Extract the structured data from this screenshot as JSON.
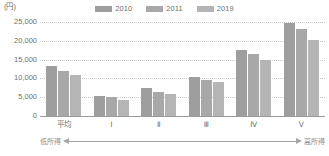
{
  "chart_data": {
    "type": "bar",
    "title": "",
    "subtitle": "",
    "unit_label": "(円)",
    "xlabel": "",
    "ylabel": "",
    "ylim": [
      0,
      25000
    ],
    "ytick_values": [
      25000,
      20000,
      15000,
      10000,
      5000,
      0
    ],
    "ytick_labels": [
      "25,000",
      "20,000",
      "15,000",
      "10,000",
      "5,000",
      "0"
    ],
    "grid": true,
    "legend_position": "top-center",
    "categories": [
      "平均",
      "Ⅰ",
      "Ⅱ",
      "Ⅲ",
      "Ⅳ",
      "Ⅴ"
    ],
    "series": [
      {
        "name": "2010",
        "color": "#9e9e9e",
        "values": [
          13200,
          5300,
          7500,
          10500,
          17600,
          24800
        ]
      },
      {
        "name": "2011",
        "color": "#a8a8a8",
        "values": [
          12100,
          5000,
          6400,
          9600,
          16500,
          23100
        ]
      },
      {
        "name": "2019",
        "color": "#b5b5b5",
        "values": [
          10800,
          4200,
          5900,
          9100,
          14900,
          20300
        ]
      }
    ],
    "annotations": {
      "income_low": "低所得",
      "income_high": "高所得",
      "arrow": "double-headed-arrow"
    }
  },
  "colors": {
    "axis": "#9a9a9a",
    "gridline": "#c9c9c9",
    "text": "#6f6f6f",
    "annotation_text": "#8a8a8a",
    "arrow": "#a6a6a6",
    "background": "#ffffff"
  }
}
